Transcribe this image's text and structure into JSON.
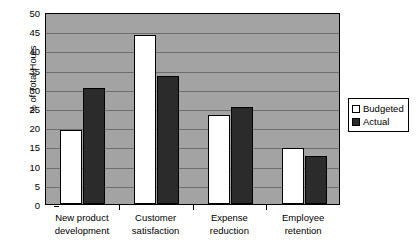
{
  "chart_data": {
    "type": "bar",
    "title": "",
    "subtitle": "",
    "xlabel": "",
    "ylabel": "% of Total Hours",
    "ylim": [
      0,
      50
    ],
    "ytick_step": 5,
    "yticks": [
      0,
      5,
      10,
      15,
      20,
      25,
      30,
      35,
      40,
      45,
      50
    ],
    "ytick_labels": [
      "0",
      "5",
      "10",
      "15",
      "20",
      "25",
      "30",
      "35",
      "40",
      "45",
      "50"
    ],
    "grid": true,
    "grid_axis": "y",
    "legend_position": "right",
    "categories": [
      "New product development",
      "Customer satisfaction",
      "Expense reduction",
      "Employee retention"
    ],
    "category_lines": [
      [
        "New product",
        "development"
      ],
      [
        "Customer",
        "satisfaction"
      ],
      [
        "Expense",
        "reduction"
      ],
      [
        "Employee",
        "retention"
      ]
    ],
    "series": [
      {
        "name": "Budgeted",
        "color": "#ffffff",
        "edge_color": "#000000",
        "values": [
          19.2,
          44.1,
          23.2,
          14.6
        ]
      },
      {
        "name": "Actual",
        "color": "#2b2b2b",
        "edge_color": "#000000",
        "values": [
          30.3,
          33.3,
          25.2,
          12.4
        ]
      }
    ]
  },
  "style": {
    "plot_background": "#a3a3a3",
    "gridline_color": "#6e6e6e",
    "axis_color": "#000000",
    "figure_background": "#ffffff",
    "legend_background": "#ffffff"
  }
}
